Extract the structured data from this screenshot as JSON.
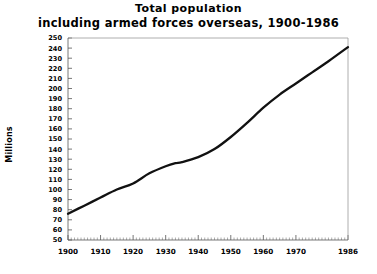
{
  "title": {
    "line1": "Total population",
    "line2": "including armed forces overseas, 1900-1986"
  },
  "axes": {
    "ylabel": "Millions"
  },
  "chart_data": {
    "type": "line",
    "title": "Total population including armed forces overseas, 1900-1986",
    "xlabel": "",
    "ylabel": "Millions",
    "xlim": [
      1900,
      1986
    ],
    "ylim": [
      50,
      250
    ],
    "ytick_step": 10,
    "xtick_step": 10,
    "grid": false,
    "legend": false,
    "line_color": "#111111",
    "xticks": [
      1900,
      1910,
      1920,
      1930,
      1940,
      1950,
      1960,
      1970,
      1986
    ],
    "xtick_labels": [
      "1900",
      "1910",
      "1920",
      "1930",
      "1940",
      "1950",
      "1960",
      "1970",
      "1986"
    ],
    "yticks": [
      50,
      60,
      70,
      80,
      90,
      100,
      110,
      120,
      130,
      140,
      150,
      160,
      170,
      180,
      190,
      200,
      210,
      220,
      230,
      240,
      250
    ],
    "ytick_labels": [
      "50",
      "60",
      "70",
      "80",
      "90",
      "100",
      "110",
      "120",
      "130",
      "140",
      "150",
      "160",
      "170",
      "180",
      "190",
      "200",
      "210",
      "220",
      "230",
      "240",
      "250"
    ],
    "x": [
      1900,
      1905,
      1910,
      1915,
      1920,
      1925,
      1930,
      1933,
      1935,
      1940,
      1945,
      1950,
      1955,
      1960,
      1965,
      1970,
      1975,
      1980,
      1986
    ],
    "values": [
      76,
      84,
      92,
      100,
      106,
      116,
      123,
      126,
      127,
      132,
      140,
      152,
      166,
      181,
      194,
      205,
      216,
      227,
      241
    ],
    "series": [
      {
        "name": "Total population including armed forces overseas",
        "values": [
          76,
          84,
          92,
          100,
          106,
          116,
          123,
          126,
          127,
          132,
          140,
          152,
          166,
          181,
          194,
          205,
          216,
          227,
          241
        ]
      }
    ]
  }
}
